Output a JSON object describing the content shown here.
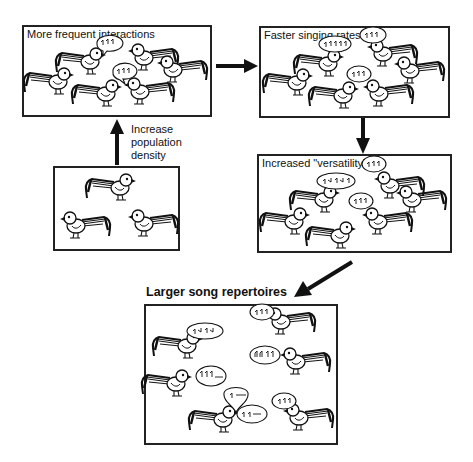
{
  "diagram": {
    "type": "flow",
    "nodes": [
      {
        "id": "initial",
        "label": "",
        "description": "sparse population of 3 birds"
      },
      {
        "id": "interactions",
        "label": "More frequent interactions",
        "birds": 6,
        "bubbles": 2
      },
      {
        "id": "singing",
        "label": "Faster singing rates",
        "birds": 6,
        "bubbles": 3
      },
      {
        "id": "versatility",
        "label": "Increased \"versatility\"",
        "birds": 6,
        "bubbles": 3
      },
      {
        "id": "repertoires",
        "label": "Larger song repertoires",
        "birds": 6,
        "bubbles": 7
      }
    ],
    "edges": [
      {
        "from": "initial",
        "to": "interactions",
        "label": "Increase population density"
      },
      {
        "from": "interactions",
        "to": "singing",
        "label": ""
      },
      {
        "from": "singing",
        "to": "versatility",
        "label": ""
      },
      {
        "from": "versatility",
        "to": "repertoires",
        "label": ""
      }
    ]
  },
  "labels": {
    "box1_title": "More frequent interactions",
    "box2_title": "Faster singing rates",
    "box3_title": "Increased \"versatility\"",
    "final_title": "Larger song repertoires",
    "density_line1": "Increase",
    "density_line2": "population",
    "density_line3": "density"
  },
  "icons": {
    "bird": "bird-icon",
    "speech_bubble": "speech-bubble-icon",
    "arrow": "arrow-icon"
  },
  "colors": {
    "ink": "#111111",
    "border": "#222222",
    "background": "#ffffff"
  }
}
